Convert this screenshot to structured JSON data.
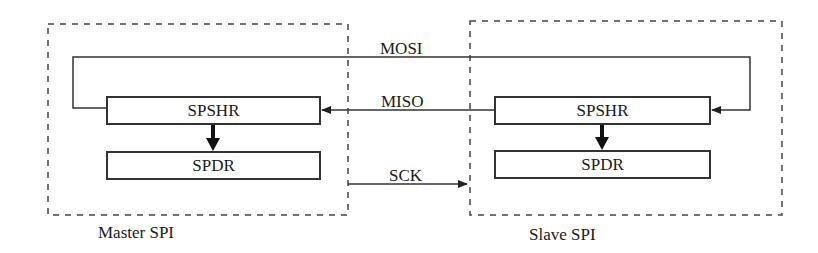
{
  "diagram": {
    "type": "SPI master-slave block diagram",
    "master": {
      "label": "Master SPI",
      "shift_register": "SPSHR",
      "data_register": "SPDR"
    },
    "slave": {
      "label": "Slave SPI",
      "shift_register": "SPSHR",
      "data_register": "SPDR"
    },
    "signals": {
      "mosi": "MOSI",
      "miso": "MISO",
      "sck": "SCK"
    },
    "colors": {
      "line": "#333333",
      "dashed_border": "#444444",
      "background": "#ffffff"
    }
  }
}
